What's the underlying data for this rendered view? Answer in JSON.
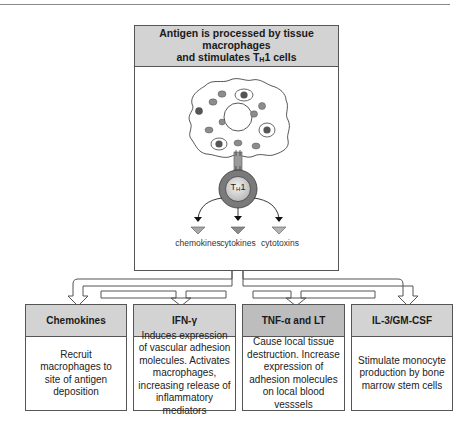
{
  "title_box": {
    "line1": "Antigen is processed by tissue macrophages",
    "line2_prefix": "and stimulates T",
    "line2_sub": "H",
    "line2_suffix": "1 cells"
  },
  "cell": {
    "th1_label_prefix": "T",
    "th1_label_sub": "H",
    "th1_label_suffix": "1"
  },
  "secretions": [
    {
      "label": "chemokines"
    },
    {
      "label": "cytokines"
    },
    {
      "label": "cytotoxins"
    }
  ],
  "effects": [
    {
      "header": "Chemokines",
      "body": "Recruit macrophages to site of antigen deposition"
    },
    {
      "header": "IFN-γ",
      "body": "Induces expression of vascular adhesion molecules. Activates macrophages, increasing release of inflammatory mediators"
    },
    {
      "header": "TNF-α and LT",
      "body": "Cause local tissue destruction. Increase expression of adhesion molecules on local blood vesssels"
    },
    {
      "header": "IL-3/GM-CSF",
      "body": "Stimulate monocyte production by bone marrow stem cells"
    }
  ],
  "colors": {
    "header_gray": "#d3d3d3",
    "header_dark_gray": "#bdbdbd",
    "border": "#555555",
    "th1_ring": "#7a7a7a",
    "organelle": "#8c8c8c"
  }
}
